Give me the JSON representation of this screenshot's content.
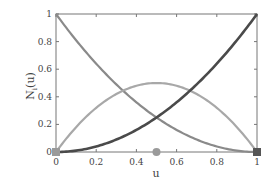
{
  "chart_data": {
    "type": "line",
    "title": "",
    "xlabel": "u",
    "ylabel": "N_i(u)",
    "xlim": [
      0,
      1
    ],
    "ylim": [
      0,
      1
    ],
    "xticks": [
      "0",
      "0.2",
      "0.4",
      "0.6",
      "0.8",
      "1"
    ],
    "yticks": [
      "0",
      "0.2",
      "0.4",
      "0.6",
      "0.8",
      "1"
    ],
    "grid": false,
    "legend": null,
    "series": [
      {
        "name": "N0 = (1-u)^2",
        "color": "#8a8a8a",
        "x": [
          0,
          0.1,
          0.2,
          0.3,
          0.4,
          0.5,
          0.6,
          0.7,
          0.8,
          0.9,
          1
        ],
        "values": [
          1,
          0.81,
          0.64,
          0.49,
          0.36,
          0.25,
          0.16,
          0.09,
          0.04,
          0.01,
          0
        ]
      },
      {
        "name": "N1 = 2u(1-u)",
        "color": "#a8a8a8",
        "x": [
          0,
          0.1,
          0.2,
          0.3,
          0.4,
          0.5,
          0.6,
          0.7,
          0.8,
          0.9,
          1
        ],
        "values": [
          0,
          0.18,
          0.32,
          0.42,
          0.48,
          0.5,
          0.48,
          0.42,
          0.32,
          0.18,
          0
        ]
      },
      {
        "name": "N2 = u^2",
        "color": "#4a4a4a",
        "x": [
          0,
          0.1,
          0.2,
          0.3,
          0.4,
          0.5,
          0.6,
          0.7,
          0.8,
          0.9,
          1
        ],
        "values": [
          0,
          0.01,
          0.04,
          0.09,
          0.16,
          0.25,
          0.36,
          0.49,
          0.64,
          0.81,
          1
        ]
      }
    ],
    "markers": [
      {
        "shape": "square",
        "x": 0,
        "y": 0,
        "color": "#9a9a9a"
      },
      {
        "shape": "circle",
        "x": 0.5,
        "y": 0,
        "color": "#9a9a9a"
      },
      {
        "shape": "square",
        "x": 1,
        "y": 0,
        "color": "#555555"
      }
    ]
  },
  "labels": {
    "xlabel": "u",
    "ylabel_main": "N",
    "ylabel_sub": "i",
    "ylabel_arg": "(u)"
  }
}
